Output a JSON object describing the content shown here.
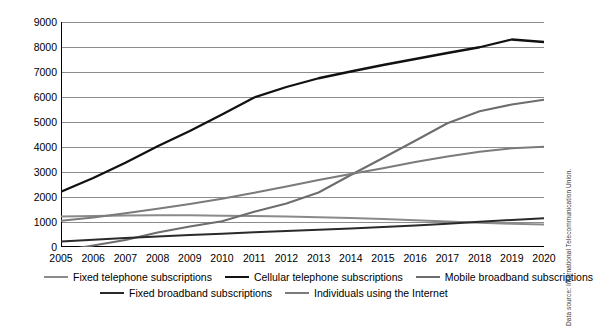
{
  "chart_data": {
    "type": "line",
    "title": "",
    "subtitle": "",
    "xlabel": "",
    "ylabel": "",
    "grid": true,
    "legend_position": "bottom",
    "xlim": [
      2005,
      2020
    ],
    "ylim": [
      0,
      9000
    ],
    "y_ticks": [
      0,
      1000,
      2000,
      3000,
      4000,
      5000,
      6000,
      7000,
      8000,
      9000
    ],
    "y_tick_labels": [
      "0",
      "1000",
      "2000",
      "3000",
      "4000",
      "5000",
      "6000",
      "7000",
      "8000",
      "9000"
    ],
    "x": [
      2005,
      2006,
      2007,
      2008,
      2009,
      2010,
      2011,
      2012,
      2013,
      2014,
      2015,
      2016,
      2017,
      2018,
      2019,
      2020
    ],
    "x_tick_labels": [
      "2005",
      "2006",
      "2007",
      "2008",
      "2009",
      "2010",
      "2011",
      "2012",
      "2013",
      "2014",
      "2015",
      "2016",
      "2017",
      "2018",
      "2019",
      "2020"
    ],
    "series": [
      {
        "name": "Fixed telephone subscriptions",
        "color": "#8a8a8a",
        "width": 2.0,
        "values": [
          1225,
          1245,
          1260,
          1270,
          1270,
          1255,
          1240,
          1220,
          1195,
          1165,
          1125,
          1070,
          1020,
          975,
          930,
          900
        ]
      },
      {
        "name": "Cellular telephone subscriptions",
        "color": "#111111",
        "width": 2.3,
        "values": [
          2210,
          2760,
          3370,
          4030,
          4640,
          5300,
          5980,
          6400,
          6750,
          7020,
          7280,
          7520,
          7760,
          7990,
          8300,
          8200
        ]
      },
      {
        "name": "Mobile broadband subscriptions",
        "color": "#6d6d6d",
        "width": 2.0,
        "values": [
          -150,
          60,
          280,
          580,
          820,
          1030,
          1410,
          1740,
          2180,
          2880,
          3560,
          4250,
          4950,
          5430,
          5700,
          5890
        ]
      },
      {
        "name": "Fixed broadband subscriptions",
        "color": "#2a2a2a",
        "width": 2.0,
        "values": [
          220,
          290,
          360,
          420,
          480,
          530,
          590,
          640,
          690,
          740,
          800,
          860,
          930,
          1010,
          1080,
          1150
        ]
      },
      {
        "name": "Individuals using the Internet",
        "color": "#7b7b7b",
        "width": 2.0,
        "values": [
          1050,
          1180,
          1350,
          1530,
          1720,
          1930,
          2170,
          2420,
          2680,
          2920,
          3150,
          3400,
          3620,
          3810,
          3950,
          4010
        ]
      }
    ],
    "annotations": []
  },
  "axes": {
    "y_labels": [
      "9000",
      "8000",
      "7000",
      "6000",
      "5000",
      "4000",
      "3000",
      "2000",
      "1000",
      "0"
    ],
    "x_labels": [
      "2005",
      "2006",
      "2007",
      "2008",
      "2009",
      "2010",
      "2011",
      "2012",
      "2013",
      "2014",
      "2015",
      "2016",
      "2017",
      "2018",
      "2019",
      "2020"
    ]
  },
  "legend": {
    "row1": [
      {
        "label": "Fixed telephone subscriptions",
        "color": "#8a8a8a",
        "width": 2.0
      },
      {
        "label": "Cellular telephone subscriptions",
        "color": "#111111",
        "width": 2.3
      },
      {
        "label": "Mobile broadband subscriptions",
        "color": "#6d6d6d",
        "width": 2.0
      }
    ],
    "row2": [
      {
        "label": "Fixed broadband subscriptions",
        "color": "#2a2a2a",
        "width": 2.0
      },
      {
        "label": "Individuals using the Internet",
        "color": "#7b7b7b",
        "width": 2.0
      }
    ]
  },
  "source": {
    "text": "Data source: International Telecommunication Union."
  }
}
